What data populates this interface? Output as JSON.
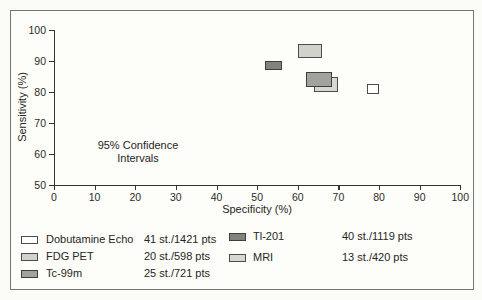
{
  "chart_data": {
    "type": "scatter",
    "subtype": "confidence-interval-boxes",
    "title": "",
    "xlabel": "Specificity (%)",
    "ylabel": "Sensitivity (%)",
    "x_axis": {
      "min": 0,
      "max": 100,
      "ticks": [
        0,
        10,
        20,
        30,
        40,
        50,
        60,
        70,
        80,
        90,
        100
      ]
    },
    "y_axis": {
      "min": 50,
      "max": 100,
      "ticks": [
        50,
        60,
        70,
        80,
        90,
        100
      ]
    },
    "grid": "off",
    "annotation": {
      "line1": "95% Confidence",
      "line2": "Intervals"
    },
    "series": [
      {
        "name": "Dobutamine Echo",
        "fill": "#ffffff",
        "border": "#4c4c48",
        "spec_ci": [
          77,
          80
        ],
        "sens_ci": [
          79.5,
          82.7
        ]
      },
      {
        "name": "FDG PET",
        "fill": "#d2d2cb",
        "border": "#4c4c48",
        "spec_ci": [
          60,
          66
        ],
        "sens_ci": [
          91,
          95.5
        ]
      },
      {
        "name": "Tl-201",
        "fill": "#83837e",
        "border": "#3f3f3b",
        "spec_ci": [
          52,
          56
        ],
        "sens_ci": [
          87,
          90
        ]
      },
      {
        "name": "MRI",
        "fill": "#d7d7d1",
        "border": "#4c4c48",
        "spec_ci": [
          64,
          70
        ],
        "sens_ci": [
          80,
          85
        ]
      },
      {
        "name": "Tc-99m",
        "fill": "#a3a39e",
        "border": "#3f3f3b",
        "spec_ci": [
          62,
          68.5
        ],
        "sens_ci": [
          81.5,
          86.5
        ]
      }
    ],
    "legend": {
      "position": "bottom",
      "columns": [
        [
          {
            "series": "Dobutamine Echo",
            "label": "Dobutamine Echo",
            "count": "41 st./1421 pts"
          },
          {
            "series": "FDG PET",
            "label": "FDG PET",
            "count": "20 st./598 pts"
          },
          {
            "series": "Tc-99m",
            "label": "Tc-99m",
            "count": "25 st./721 pts"
          }
        ],
        [
          {
            "series": "Tl-201",
            "label": "Tl-201",
            "count": "40 st./1119 pts"
          },
          {
            "series": "MRI",
            "label": "MRI",
            "count": "13 st./420 pts"
          }
        ]
      ]
    }
  }
}
